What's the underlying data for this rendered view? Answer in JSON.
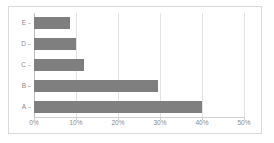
{
  "chart_data": {
    "type": "bar",
    "orientation": "horizontal",
    "title": "",
    "xlabel": "",
    "ylabel": "",
    "categories": [
      "E",
      "D",
      "C",
      "B",
      "A"
    ],
    "values": [
      8.5,
      10,
      12,
      29.5,
      40
    ],
    "value_suffix": "%",
    "xlim": [
      0,
      50
    ],
    "xticks": [
      0,
      10,
      20,
      30,
      40,
      50
    ],
    "xtick_labels": [
      "0%",
      "10%",
      "20%",
      "30%",
      "40%",
      "50%"
    ],
    "grid": true,
    "grid_axis": "x",
    "legend": false,
    "bar_color": "#7f7f7f",
    "gridline_color": "#e3e3e3",
    "axis_color": "#bdbdbd",
    "tick_label_color": "#8a8a8a",
    "background_color": "#ffffff",
    "border_color": "#d9d9d9"
  }
}
